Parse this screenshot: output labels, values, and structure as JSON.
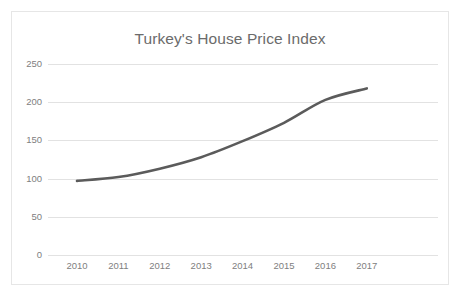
{
  "chart_data": {
    "type": "line",
    "title": "Turkey's House Price Index",
    "xlabel": "",
    "ylabel": "",
    "categories": [
      "2010",
      "2011",
      "2012",
      "2013",
      "2014",
      "2015",
      "2016",
      "2017"
    ],
    "values": [
      97,
      102,
      113,
      128,
      149,
      173,
      203,
      218
    ],
    "series": [
      {
        "name": "Turkey's House Price Index",
        "values": [
          97,
          102,
          113,
          128,
          149,
          173,
          203,
          218
        ]
      }
    ],
    "ylim": [
      0,
      250
    ],
    "y_ticks": [
      0,
      50,
      100,
      150,
      200,
      250
    ],
    "y_tick_labels": [
      "0",
      "50",
      "100",
      "150",
      "200",
      "250"
    ],
    "x_tick_labels": [
      "2010",
      "2011",
      "2012",
      "2013",
      "2014",
      "2015",
      "2016",
      "2017"
    ],
    "grid": true,
    "grid_axis": "y",
    "legend": false,
    "legend_position": "none",
    "colors": {
      "line": "#5b5b5b",
      "gridline": "#e2e2e2",
      "tick_label": "#808080",
      "title": "#6b6b6b",
      "border": "#e6e6e6",
      "background": "#ffffff"
    }
  }
}
